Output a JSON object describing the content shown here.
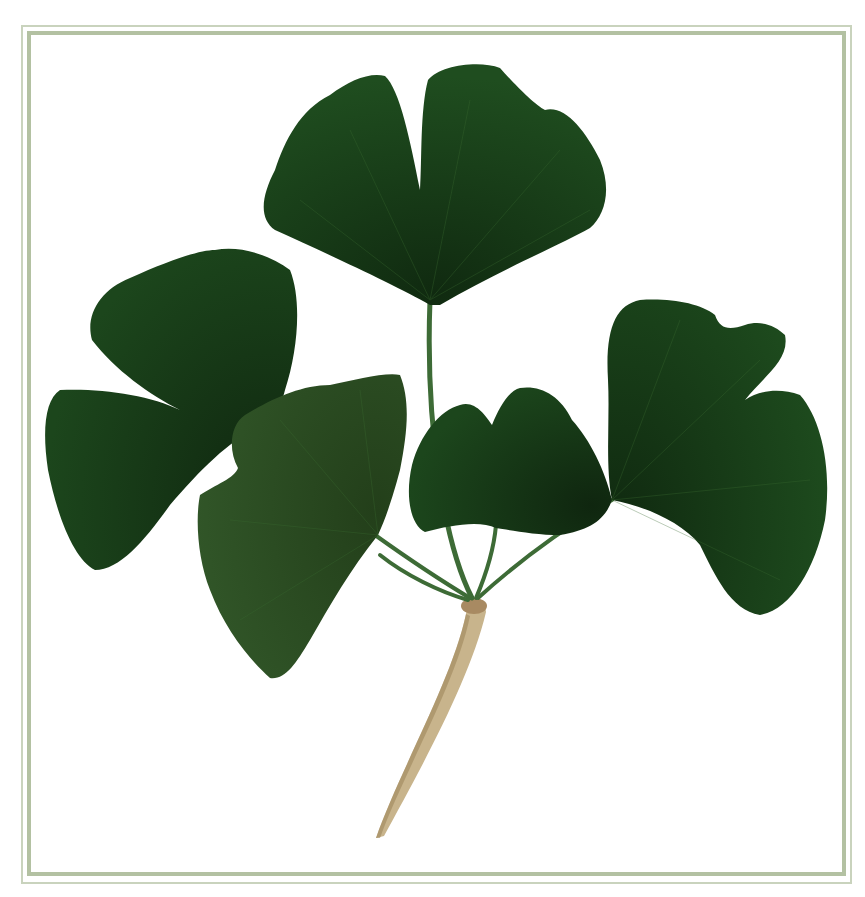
{
  "image": {
    "subject": "pressed ginkgo leaves on a branch",
    "leaf_count": 5,
    "background": "#ffffff",
    "frame": {
      "outer_color": "#c9d3bd",
      "inner_color": "#b3c1a2"
    },
    "colors": {
      "leaf_dark": "#173a17",
      "leaf_mid": "#1f4a1f",
      "leaf_light": "#2e5a24",
      "petiole": "#3d6b36",
      "twig": "#c8b48c",
      "twig_shadow": "#9e875c"
    },
    "leaves": [
      {
        "id": "top",
        "position": "top-center"
      },
      {
        "id": "upper-left",
        "position": "left"
      },
      {
        "id": "front-left",
        "position": "center-left"
      },
      {
        "id": "small-center",
        "position": "center"
      },
      {
        "id": "right",
        "position": "right"
      }
    ]
  }
}
